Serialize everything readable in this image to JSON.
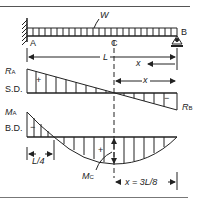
{
  "diagram": {
    "load_label": "W",
    "points": {
      "A": "A",
      "B": "B",
      "C": "C"
    },
    "length_label": "L",
    "x_label": "x",
    "shear": {
      "label": "S.D.",
      "ra_label": "R",
      "ra_sub": "A",
      "rb_label": "R",
      "rb_sub": "B",
      "plus": "+",
      "minus": "−"
    },
    "moment": {
      "label": "B.D.",
      "ma_label": "M",
      "ma_sub": "A",
      "mc_label": "M",
      "mc_sub": "C",
      "plus": "+",
      "minus": "−",
      "quarter_label": "L/4",
      "x_eq_label": "x = 3L/8"
    },
    "colors": {
      "ink": "#222222",
      "background": "#ffffff"
    }
  }
}
